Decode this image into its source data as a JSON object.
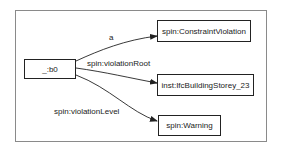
{
  "diagram": {
    "type": "rdf-graph",
    "nodes": [
      {
        "id": "b0",
        "label": "_:b0"
      },
      {
        "id": "cv",
        "label": "spin:ConstraintViolation"
      },
      {
        "id": "storey",
        "label": "inst:IfcBuildingStorey_23"
      },
      {
        "id": "warning",
        "label": "spin:Warning"
      }
    ],
    "edges": [
      {
        "from": "b0",
        "to": "cv",
        "label": "a"
      },
      {
        "from": "b0",
        "to": "storey",
        "label": "spin:violationRoot"
      },
      {
        "from": "b0",
        "to": "warning",
        "label": "spin:violationLevel"
      }
    ],
    "colors": {
      "stroke": "#222222",
      "frame": "#8a8a8a",
      "background": "#ffffff"
    }
  }
}
